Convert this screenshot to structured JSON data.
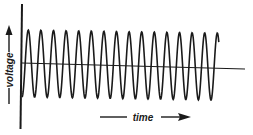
{
  "diagram": {
    "title": "",
    "y_axis_label": "voltage",
    "x_axis_label": "time",
    "colors": {
      "ink": "#1a1a1a",
      "background": "#ffffff"
    },
    "waveform": {
      "type": "sine",
      "cycles_visible": 15,
      "start_x": 22,
      "end_x": 219,
      "period_px": 12.6,
      "peak_y": 30,
      "trough_y": 97,
      "baseline_start": [
        22,
        63
      ],
      "baseline_end": [
        245,
        69
      ]
    }
  }
}
